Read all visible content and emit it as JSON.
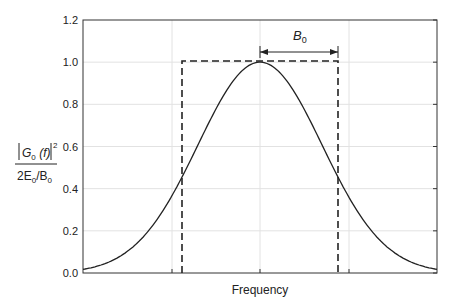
{
  "chart_data": {
    "type": "line",
    "title": "",
    "xlabel": "Frequency",
    "ylabel": "|G0(f)|^2 / (2E0/B0)",
    "ylim": [
      0,
      1.2
    ],
    "yticks": [
      "0.0",
      "0.2",
      "0.4",
      "0.6",
      "0.8",
      "1.0",
      "1.2"
    ],
    "grid": true,
    "series": [
      {
        "name": "Gaussian spectrum",
        "style": "solid",
        "description": "Gaussian centered at f=0, peak 1.0, crosses ~0.46 at f=±B0"
      },
      {
        "name": "Rectangular (ideal) spectrum",
        "style": "dashed",
        "description": "Height 1.0 from -B0 to +B0"
      }
    ],
    "annotations": [
      {
        "text": "B0",
        "type": "double-arrow",
        "from": "f=0",
        "to": "f=B0",
        "y": 1.07
      }
    ]
  },
  "labels": {
    "xlabel": "Frequency",
    "y_num_G": "G",
    "y_num_sub": "0",
    "y_num_f": " (f)",
    "y_num_sup": "2",
    "y_den": "2E",
    "y_den_sub1": "0",
    "y_den_mid": "/B",
    "y_den_sub2": "0",
    "annot": "B",
    "annot_sub": "0",
    "ticks": [
      "0.0",
      "0.2",
      "0.4",
      "0.6",
      "0.8",
      "1.0",
      "1.2"
    ]
  }
}
